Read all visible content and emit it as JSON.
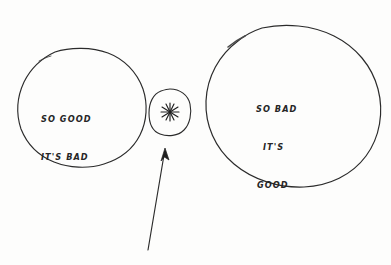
{
  "image": {
    "kind": "hand-drawn-cartoon-diagram",
    "background_color": "#fdfdfc",
    "ink_color": "#262626"
  },
  "shapes": {
    "left_circle": {
      "name": "so-good-its-bad-circle",
      "text_lines": [
        "SO GOOD",
        "IT'S BAD"
      ],
      "center_x": 81,
      "center_y": 106,
      "radius_x": 63,
      "radius_y": 58
    },
    "middle_circle": {
      "name": "asterisk-circle",
      "icon": "asterisk-starburst",
      "glyph": "✳",
      "center_x": 170,
      "center_y": 112,
      "radius_x": 20,
      "radius_y": 23
    },
    "right_circle": {
      "name": "so-bad-its-good-circle",
      "text_lines": [
        "SO BAD",
        "IT'S",
        "GOOD"
      ],
      "center_x": 293,
      "center_y": 105,
      "radius_x": 88,
      "radius_y": 80
    }
  },
  "annotation_arrow": {
    "name": "pointer-arrow",
    "points_to": "asterisk-circle",
    "tail_x": 148,
    "tail_y": 250,
    "head_x": 165,
    "head_y": 150
  }
}
